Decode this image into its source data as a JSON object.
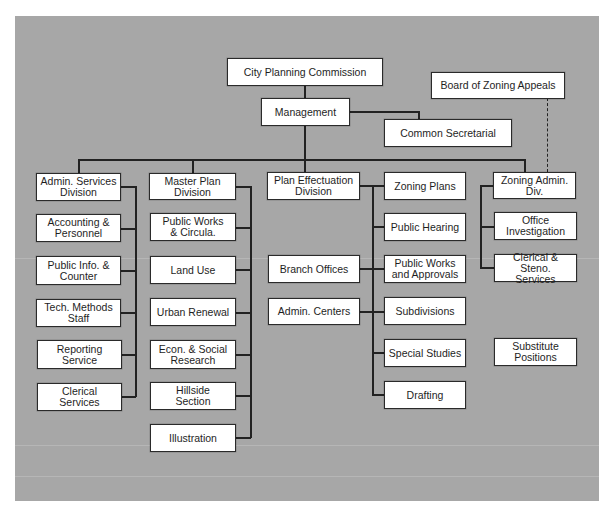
{
  "top": {
    "commission": "City Planning Commission",
    "management": "Management",
    "secretarial": "Common Secretarial",
    "board": "Board of Zoning Appeals"
  },
  "divisions": {
    "admin": {
      "title": "Admin. Services Division",
      "title_lines": [
        "Admin. Services",
        "Division"
      ],
      "units": [
        {
          "l1": "Accounting &",
          "l2": "Personnel"
        },
        {
          "l1": "Public Info. &",
          "l2": "Counter"
        },
        {
          "l1": "Tech. Methods",
          "l2": "Staff"
        },
        {
          "l1": "Reporting",
          "l2": "Service"
        },
        {
          "l1": "Clerical",
          "l2": "Services"
        }
      ]
    },
    "master": {
      "title_lines": [
        "Master Plan",
        "Division"
      ],
      "units": [
        {
          "l1": "Public Works",
          "l2": "& Circula."
        },
        {
          "l1": "Land Use",
          "l2": ""
        },
        {
          "l1": "Urban Renewal",
          "l2": ""
        },
        {
          "l1": "Econ. & Social",
          "l2": "Research"
        },
        {
          "l1": "Hillside",
          "l2": "Section"
        },
        {
          "l1": "Illustration",
          "l2": ""
        }
      ]
    },
    "effectuation": {
      "title_lines": [
        "Plan Effectuation",
        "Division"
      ],
      "left_units": [
        {
          "l1": "Branch Offices",
          "l2": ""
        },
        {
          "l1": "Admin. Centers",
          "l2": ""
        }
      ],
      "right_units": [
        {
          "l1": "Zoning Plans",
          "l2": ""
        },
        {
          "l1": "Public Hearing",
          "l2": ""
        },
        {
          "l1": "Public Works",
          "l2": "and Approvals"
        },
        {
          "l1": "Subdivisions",
          "l2": ""
        },
        {
          "l1": "Special Studies",
          "l2": ""
        },
        {
          "l1": "Drafting",
          "l2": ""
        }
      ]
    },
    "zoning": {
      "title_lines": [
        "Zoning Admin.",
        "Div."
      ],
      "units": [
        {
          "l1": "Office",
          "l2": "Investigation"
        },
        {
          "l1": "Clerical & Steno.",
          "l2": "Services"
        }
      ]
    }
  },
  "standalone": {
    "l1": "Substitute",
    "l2": "Positions"
  },
  "colors": {
    "background": "#a7a7a7",
    "box": "#ffffff",
    "line": "#222222"
  }
}
